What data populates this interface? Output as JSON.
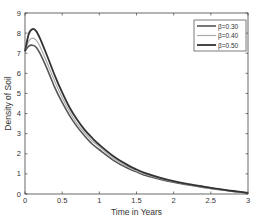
{
  "chart_data": {
    "type": "line",
    "title": "",
    "xlabel": "Time in Years",
    "ylabel": "Density of Soil",
    "xlim": [
      0,
      3
    ],
    "ylim": [
      0,
      9
    ],
    "xticks": [
      "0",
      "0.5",
      "1",
      "1.5",
      "2",
      "2.5",
      "3"
    ],
    "yticks": [
      "0",
      "1",
      "2",
      "3",
      "4",
      "5",
      "6",
      "7",
      "8",
      "9"
    ],
    "grid": false,
    "legend_position": "top-right",
    "x": [
      0,
      0.05,
      0.1,
      0.15,
      0.2,
      0.3,
      0.4,
      0.5,
      0.6,
      0.7,
      0.8,
      0.9,
      1.0,
      1.2,
      1.4,
      1.5,
      1.6,
      1.8,
      2.0,
      2.2,
      2.4,
      2.5,
      2.6,
      2.8,
      3.0
    ],
    "series": [
      {
        "name": "β=0.30",
        "color": "#555555",
        "width": 1.6,
        "values": [
          7.1,
          7.35,
          7.4,
          7.3,
          7.0,
          6.2,
          5.3,
          4.55,
          3.9,
          3.35,
          2.9,
          2.5,
          2.2,
          1.65,
          1.25,
          1.1,
          0.95,
          0.75,
          0.58,
          0.45,
          0.33,
          0.28,
          0.22,
          0.13,
          0.05
        ]
      },
      {
        "name": "β=0.40",
        "color": "#aaaaaa",
        "width": 1.2,
        "values": [
          7.1,
          7.6,
          7.75,
          7.65,
          7.35,
          6.5,
          5.6,
          4.8,
          4.1,
          3.5,
          3.05,
          2.65,
          2.35,
          1.75,
          1.32,
          1.15,
          1.0,
          0.79,
          0.61,
          0.47,
          0.35,
          0.29,
          0.23,
          0.14,
          0.06
        ]
      },
      {
        "name": "β=0.50",
        "color": "#333333",
        "width": 1.8,
        "values": [
          7.1,
          7.95,
          8.2,
          8.1,
          7.75,
          6.85,
          5.9,
          5.05,
          4.3,
          3.7,
          3.2,
          2.8,
          2.45,
          1.85,
          1.4,
          1.22,
          1.06,
          0.83,
          0.64,
          0.49,
          0.37,
          0.31,
          0.25,
          0.15,
          0.06
        ]
      }
    ]
  }
}
